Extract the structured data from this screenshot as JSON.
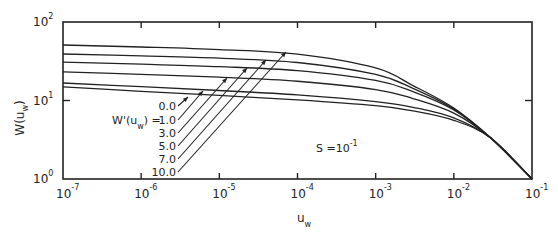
{
  "chart_data": {
    "type": "line",
    "title": "",
    "xlabel": "u_w",
    "ylabel": "W(u_w)",
    "xscale": "log",
    "yscale": "log",
    "xlim": [
      1e-07,
      0.1
    ],
    "ylim": [
      1,
      100
    ],
    "grid": false,
    "x_ticks": [
      "10^-7",
      "10^-6",
      "10^-5",
      "10^-4",
      "10^-3",
      "10^-2",
      "10^-1"
    ],
    "y_ticks": [
      "10^0",
      "10^1",
      "10^2"
    ],
    "annotation": "S = 10^-1",
    "legend_title": "W'(u_w) =",
    "x": [
      1e-07,
      1e-06,
      1e-05,
      0.0001,
      0.001,
      0.003,
      0.01,
      0.03,
      0.1
    ],
    "series": [
      {
        "name": "0.0",
        "values": [
          14.9,
          13.1,
          11.6,
          10.2,
          8.6,
          7.4,
          5.6,
          3.3,
          1.0
        ]
      },
      {
        "name": "1.0",
        "values": [
          16.7,
          15.0,
          13.4,
          11.8,
          9.7,
          8.2,
          6.0,
          3.3,
          1.0
        ]
      },
      {
        "name": "3.0",
        "values": [
          23.1,
          21.5,
          19.8,
          17.6,
          13.8,
          10.6,
          6.9,
          3.3,
          1.0
        ]
      },
      {
        "name": "5.0",
        "values": [
          30.9,
          29.0,
          27.0,
          24.0,
          18.0,
          13.0,
          7.6,
          3.3,
          1.0
        ]
      },
      {
        "name": "7.0",
        "values": [
          39.1,
          37.0,
          34.6,
          30.5,
          21.5,
          14.3,
          7.8,
          3.3,
          1.0
        ]
      },
      {
        "name": "10.0",
        "values": [
          50.9,
          48.0,
          44.5,
          39.0,
          26.0,
          15.5,
          8.0,
          3.3,
          1.0
        ]
      }
    ]
  },
  "labels": {
    "y_axis": "W(u",
    "y_axis_sub": "w",
    "y_axis_end": ")",
    "x_axis": "u",
    "x_axis_sub": "w",
    "legend_prefix": "W'(u",
    "legend_prefix_sub": "w",
    "legend_prefix_end": ") =",
    "s_label": "S =10",
    "s_exp": "-1",
    "tick_base": "10",
    "x_tick_exps": [
      "-7",
      "-6",
      "-5",
      "-4",
      "-3",
      "-2",
      "-1"
    ],
    "y_tick_exps": [
      "0",
      "1",
      "2"
    ],
    "curve_labels": [
      "0.0",
      "1.0",
      "3.0",
      "5.0",
      "7.0",
      "10.0"
    ]
  }
}
